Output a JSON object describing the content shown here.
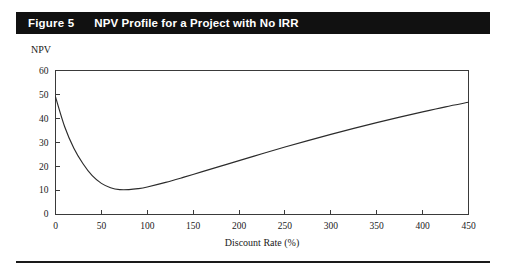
{
  "figure": {
    "number_label": "Figure 5",
    "title": "NPV Profile for a Project with No IRR",
    "banner_color": "#111111",
    "banner_text_color": "#ffffff"
  },
  "chart_data": {
    "type": "line",
    "title": "NPV Profile for a Project with No IRR",
    "xlabel": "Discount Rate (%)",
    "ylabel": "NPV",
    "xlim": [
      0,
      450
    ],
    "ylim": [
      0,
      60
    ],
    "grid": false,
    "legend": null,
    "xticks": [
      0,
      50,
      100,
      150,
      200,
      250,
      300,
      350,
      400,
      450
    ],
    "xtick_labels": [
      "0",
      "50",
      "100",
      "150",
      "200",
      "250",
      "300",
      "350",
      "400",
      "450"
    ],
    "yticks": [
      0,
      10,
      20,
      30,
      40,
      50,
      60
    ],
    "ytick_labels": [
      "0",
      "10",
      "20",
      "30",
      "40",
      "50",
      "60"
    ],
    "line_color": "#2b2b2b",
    "series": [
      {
        "name": "NPV",
        "x": [
          0,
          10,
          20,
          30,
          40,
          50,
          60,
          70,
          80,
          90,
          100,
          120,
          140,
          160,
          180,
          200,
          225,
          250,
          275,
          300,
          325,
          350,
          375,
          400,
          425,
          450
        ],
        "values": [
          49.0,
          36.5,
          27.5,
          21.0,
          16.0,
          12.8,
          11.0,
          10.2,
          10.2,
          10.6,
          11.3,
          13.2,
          15.4,
          17.7,
          20.0,
          22.3,
          25.2,
          28.0,
          30.7,
          33.3,
          35.8,
          38.2,
          40.5,
          42.7,
          44.8,
          46.7
        ]
      }
    ],
    "annotations": {
      "y_axis_start_value": 49.0,
      "minimum_point": {
        "x": 70,
        "y": 10.2
      },
      "end_point": {
        "x": 450,
        "y": 46.7
      }
    }
  },
  "axis_labels": {
    "y_axis_title": "NPV",
    "x_axis_title": "Discount Rate (%)"
  }
}
